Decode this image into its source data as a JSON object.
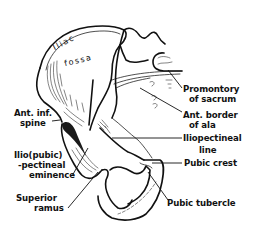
{
  "figure": {
    "region_labels": {
      "iliac_line1": "Iliac",
      "iliac_line2": "fossa"
    },
    "labels": {
      "promontory_line1": "Promontory",
      "promontory_line2": "of sacrum",
      "ant_border_line1": "Ant. border",
      "ant_border_line2": "of ala",
      "iliopectineal_line1": "Iliopectineal",
      "iliopectineal_line2": "line",
      "pubic_crest": "Pubic crest",
      "pubic_tubercle": "Pubic tubercle",
      "ant_inf_line1": "Ant. inf.",
      "ant_inf_line2": "spine",
      "eminence_line1": "Ilio(pubic)",
      "eminence_line2": "-pectineal",
      "eminence_line3": "eminence",
      "superior_line1": "Superior",
      "superior_line2": "ramus"
    },
    "colors": {
      "ink": "#111111",
      "paper": "#ffffff"
    }
  }
}
